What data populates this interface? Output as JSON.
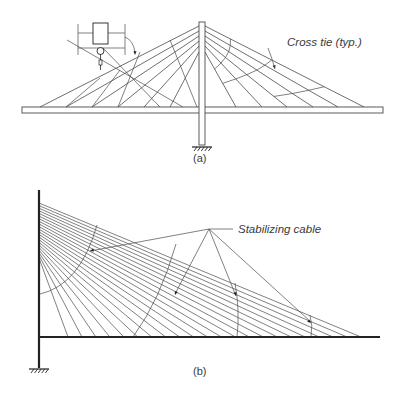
{
  "figure_a": {
    "caption": "(a)",
    "label_cross_tie": "Cross tie (typ.)",
    "pylon": {
      "x": 199,
      "w": 6,
      "top": 22,
      "bottom": 145
    },
    "deck": {
      "x1": 22,
      "x2": 383,
      "y": 107,
      "h": 6
    },
    "right_cables": [
      {
        "py": 30,
        "dx": 236
      },
      {
        "py": 35,
        "dx": 262
      },
      {
        "py": 40,
        "dx": 287
      },
      {
        "py": 45,
        "dx": 313
      },
      {
        "py": 50,
        "dx": 338
      },
      {
        "py": 30,
        "dx": 364
      }
    ],
    "left_cables": [
      {
        "py": 30,
        "dx": 40
      },
      {
        "py": 35,
        "dx": 66
      },
      {
        "py": 40,
        "dx": 92
      },
      {
        "py": 45,
        "dx": 118
      },
      {
        "py": 50,
        "dx": 144
      },
      {
        "py": 55,
        "dx": 170
      }
    ]
  },
  "figure_b": {
    "caption": "(b)",
    "label_stabilizing_cable": "Stabilizing cable",
    "pylon": {
      "x": 39,
      "top": 190,
      "bottom": 368
    },
    "deck": {
      "x1": 39,
      "x2": 380,
      "y": 337
    },
    "cable_count": 22,
    "cable_anchor_top": 203,
    "cable_anchor_bottom": 258,
    "cable_deck_first": 68,
    "cable_deck_last": 361,
    "leader_focus": {
      "x": 209,
      "y": 229
    }
  },
  "colors": {
    "line": "#4a4a4a",
    "heavy": "#222222",
    "text": "#3a3a3a"
  }
}
